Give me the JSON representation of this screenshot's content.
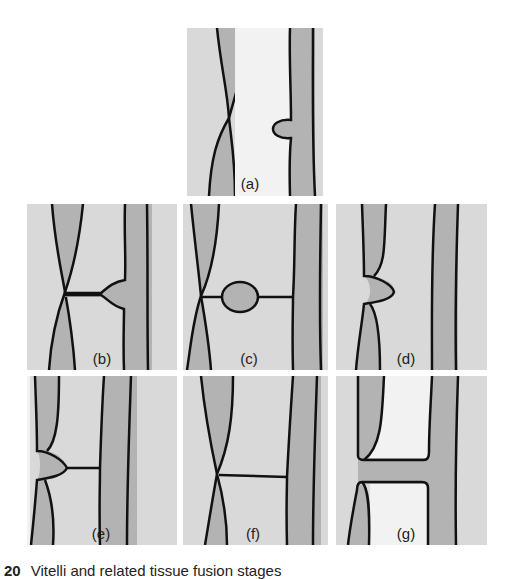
{
  "figure": {
    "panels": [
      {
        "id": "a",
        "label": "(a)"
      },
      {
        "id": "b",
        "label": "(b)"
      },
      {
        "id": "c",
        "label": "(c)"
      },
      {
        "id": "d",
        "label": "(d)"
      },
      {
        "id": "e",
        "label": "(e)"
      },
      {
        "id": "f",
        "label": "(f)"
      },
      {
        "id": "g",
        "label": "(g)"
      }
    ],
    "caption": {
      "number": "20",
      "text": "Vitelli and related tissue fusion stages"
    }
  },
  "colors": {
    "background": "#d9d9d9",
    "tissue": "#b3b3b3",
    "lumen": "#f2f2f2",
    "outline": "#111111"
  }
}
